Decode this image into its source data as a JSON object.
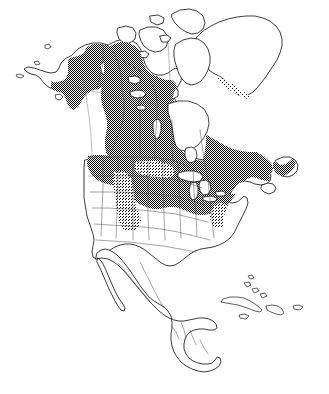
{
  "figure": {
    "kind": "species-range-map",
    "title": "",
    "caption": "",
    "projection_note": "",
    "background_color": "#ffffff",
    "outline_color": "#1a1a1a",
    "internal_border_color": "#4a4a4a",
    "shade_color": "#000000",
    "shade_style": "stippled-checkerboard-dither",
    "shade_density_main": "50%",
    "shade_density_montane": "25%"
  },
  "legend": {
    "present": false,
    "entries": [
      {
        "label": "",
        "swatch": "#7f7f7f",
        "description": ""
      }
    ]
  },
  "regions": {
    "shaded": [
      "Alaska",
      "Yukon",
      "Northwest Territories (south of treeline)",
      "British Columbia",
      "Alberta",
      "Saskatchewan",
      "Manitoba",
      "Ontario",
      "Quebec",
      "Labrador",
      "Newfoundland",
      "New Brunswick",
      "Nova Scotia",
      "Prince Edward Island",
      "northern Washington",
      "northern Idaho",
      "western Montana",
      "Rocky Mountains (Wyoming, Colorado, Utah)",
      "northern Minnesota",
      "northern Wisconsin",
      "northern Michigan",
      "New England",
      "New York",
      "Appalachian Mountains (Pennsylvania, West Virginia)",
      "southwestern Greenland coast"
    ],
    "unshaded": [
      "Arctic Archipelago",
      "most of Greenland",
      "central and southern United States",
      "Mexico",
      "Central America",
      "Cuba",
      "Hispaniola",
      "Jamaica",
      "Puerto Rico",
      "Bahamas"
    ],
    "water": [
      "Hudson Bay",
      "Great Lakes",
      "Great Slave Lake",
      "Great Bear Lake",
      "Lake Winnipeg",
      "Gulf of Mexico",
      "Atlantic Ocean",
      "Pacific Ocean",
      "Arctic Ocean"
    ]
  }
}
